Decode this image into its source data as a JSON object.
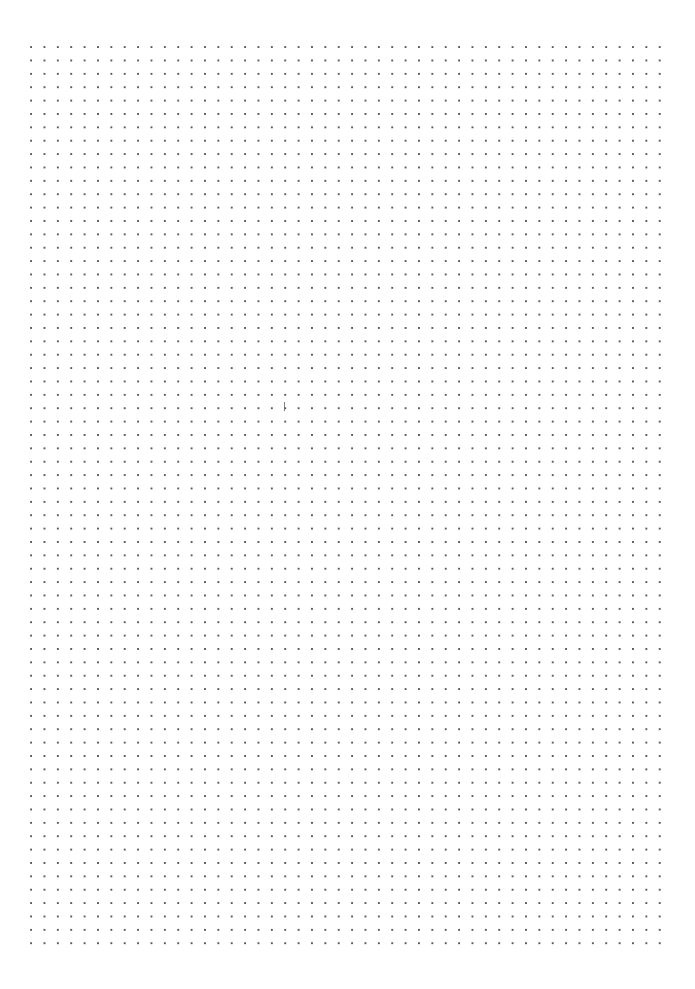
{
  "page": {
    "kind": "dot-grid-paper",
    "width_px": 695,
    "height_px": 989,
    "background_color": "#ffffff",
    "title": "",
    "visible_text": ""
  },
  "grid": {
    "dot_color": "#5a5a62",
    "dot_size_px": 1.7,
    "spacing_px": 13.38,
    "origin_x_px": 31,
    "origin_y_px": 47,
    "columns": 48,
    "rows": 68,
    "last_dot_x_px": 660,
    "last_dot_y_px": 947
  },
  "margins": {
    "top_px": 45,
    "bottom_px": 40,
    "left_px": 29,
    "right_px": 33
  },
  "marks": [
    {
      "name": "caret-mark",
      "description": "faint short vertical stroke",
      "x_px": 284,
      "y_px": 402,
      "width_px": 1.4,
      "height_px": 9,
      "color": "#6b6b73"
    }
  ]
}
